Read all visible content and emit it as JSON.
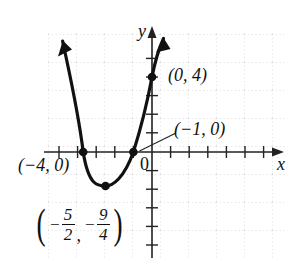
{
  "figure": {
    "kind": "parabola-graph",
    "axes": {
      "x_label": "x",
      "y_label": "y",
      "origin_label": "0",
      "x_axis_y_px": 152,
      "y_axis_x_px": 152,
      "unit_px": 18.6,
      "x_tick_min": -5,
      "x_tick_max": 7,
      "y_tick_min": -6,
      "y_tick_max": 5
    },
    "grid": {
      "style": "dotted",
      "spacing_px": 28,
      "left_px": 48,
      "top_px": 32,
      "right_px": 285,
      "bottom_px": 258,
      "color": "#c8c8c8"
    },
    "curve": {
      "type": "parabola",
      "opens": "up",
      "equation": "y = x^2 + 5x + 4",
      "color": "#111111",
      "stroke_width": 3
    },
    "points": [
      {
        "id": "x-intercept-left",
        "x": -4,
        "y": 0,
        "label": "(−4, 0)",
        "label_x_px": 20,
        "label_y_px": 158
      },
      {
        "id": "x-intercept-right",
        "x": -1,
        "y": 0,
        "label": "(−1, 0)",
        "label_x_px": 174,
        "label_y_px": 120,
        "leader": true
      },
      {
        "id": "y-intercept",
        "x": 0,
        "y": 4,
        "label": "(0, 4)",
        "label_x_px": 168,
        "label_y_px": 66
      },
      {
        "id": "vertex",
        "x": -2.5,
        "y": -2.25,
        "label": "(−5/2, −9/4)"
      }
    ],
    "vertex_label": {
      "open_paren": "(",
      "close_paren": ")",
      "minus": "−",
      "x_numerator": "5",
      "x_denominator": "2",
      "comma": ",",
      "y_numerator": "9",
      "y_denominator": "4"
    }
  }
}
